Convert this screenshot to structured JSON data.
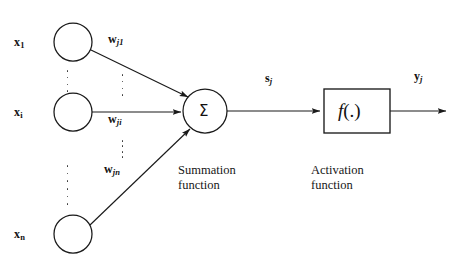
{
  "figure": {
    "colors": {
      "stroke": "#1a1a1a",
      "text": "#111111",
      "background": "#ffffff"
    }
  },
  "inputs": [
    {
      "id": "input-1",
      "symbol": "x",
      "subscript": "1"
    },
    {
      "id": "input-i",
      "symbol": "x",
      "subscript": "i"
    },
    {
      "id": "input-n",
      "symbol": "x",
      "subscript": "n"
    }
  ],
  "weights": [
    {
      "id": "weight-j1",
      "symbol": "w",
      "subscript": "j1"
    },
    {
      "id": "weight-ji",
      "symbol": "w",
      "subscript": "ji"
    },
    {
      "id": "weight-jn",
      "symbol": "w",
      "subscript": "jn"
    }
  ],
  "summation": {
    "glyph": "Σ",
    "caption_line1": "Summation",
    "caption_line2": "function",
    "output": {
      "symbol": "s",
      "subscript": "j"
    }
  },
  "activation": {
    "box_label_italic": "f",
    "box_label_rest": "(.)",
    "caption_line1": "Activation",
    "caption_line2": "function",
    "output": {
      "symbol": "y",
      "subscript": "j"
    }
  },
  "ellipses": [
    {
      "id": "ellipsis-inputs-upper",
      "dots": 4
    },
    {
      "id": "ellipsis-inputs-lower",
      "dots": 6
    },
    {
      "id": "ellipsis-weights-upper",
      "dots": 4
    },
    {
      "id": "ellipsis-weights-lower",
      "dots": 4
    }
  ]
}
